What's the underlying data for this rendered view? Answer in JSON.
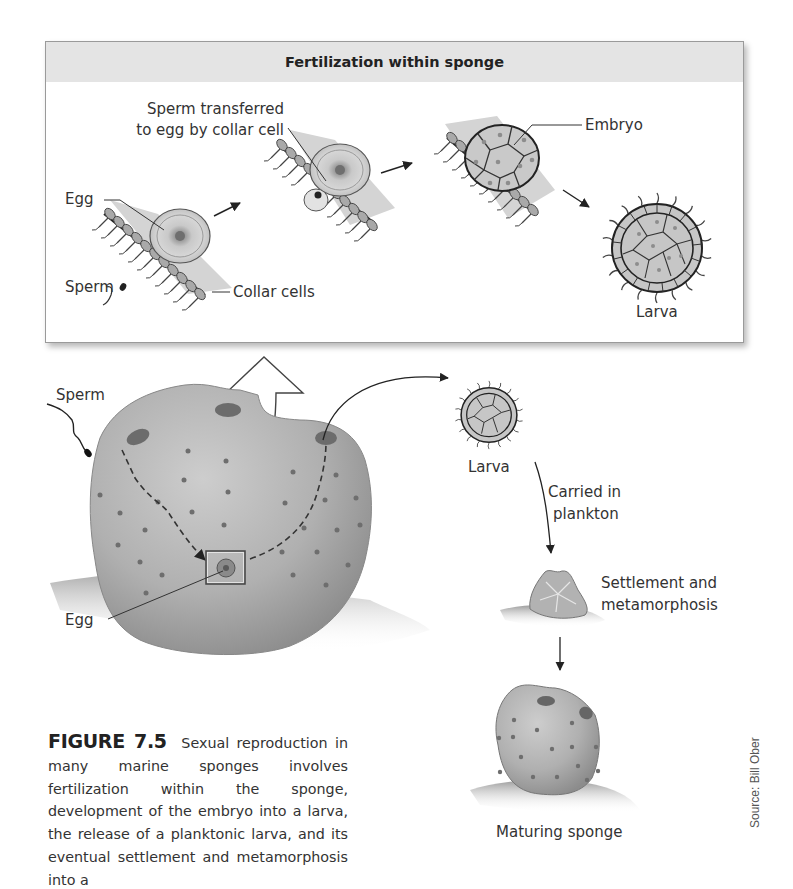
{
  "figure": {
    "inset": {
      "title": "Fertilization within sponge",
      "labels": {
        "sperm_transferred_line1": "Sperm transferred",
        "sperm_transferred_line2": "to egg by collar cell",
        "egg": "Egg",
        "sperm": "Sperm",
        "collar_cells": "Collar cells",
        "embryo": "Embryo",
        "larva": "Larva"
      }
    },
    "main": {
      "labels": {
        "sperm": "Sperm",
        "egg": "Egg",
        "larva": "Larva",
        "carried_line1": "Carried in",
        "carried_line2": "plankton",
        "settlement_line1": "Settlement and",
        "settlement_line2": "metamorphosis",
        "maturing": "Maturing sponge"
      }
    },
    "caption": {
      "number": "FIGURE 7.5",
      "text": "Sexual reproduction in many marine sponges involves fertilization within the sponge, development of the embryo into a larva, the release of a planktonic larva, and its eventual settlement and metamorphosis into a"
    },
    "source": "Source: Bill Ober",
    "colors": {
      "sponge_fill": "#b4b4b4",
      "sponge_shadow": "#8e8e8e",
      "header_bg": "#e4e4e4",
      "cell_fill": "#c6c6c6",
      "line": "#333333"
    }
  }
}
